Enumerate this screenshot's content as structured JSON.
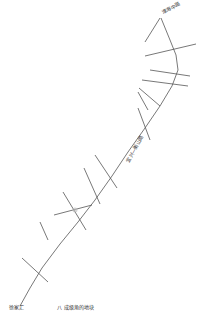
{
  "map": {
    "labels": {
      "top_endpoint": "淮海中路",
      "bottom_endpoint": "徐家汇",
      "road_name": "宜兴—衡山路",
      "legend": "八 成级角的地块"
    },
    "colors": {
      "line": "#555555",
      "background": "#ffffff",
      "text": "#333333"
    }
  }
}
